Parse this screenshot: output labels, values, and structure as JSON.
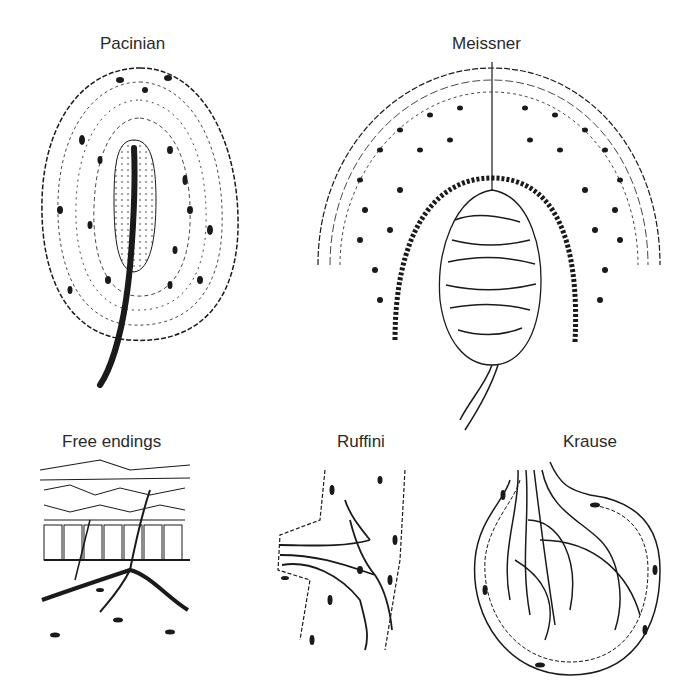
{
  "figure": {
    "panels": [
      {
        "id": "pacinian",
        "label": "Pacinian"
      },
      {
        "id": "meissner",
        "label": "Meissner"
      },
      {
        "id": "free-endings",
        "label": "Free endings"
      },
      {
        "id": "ruffini",
        "label": "Ruffini"
      },
      {
        "id": "krause",
        "label": "Krause"
      }
    ],
    "colors": {
      "ink": "#1a1a1a",
      "background": "#ffffff"
    }
  }
}
